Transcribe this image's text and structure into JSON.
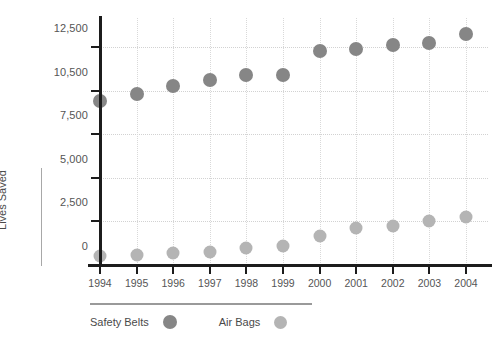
{
  "chart_data": {
    "type": "scatter",
    "title": "",
    "xlabel": "",
    "ylabel": "Lives Saved",
    "categories": [
      "1994",
      "1995",
      "1996",
      "1997",
      "1998",
      "1999",
      "2000",
      "2001",
      "2002",
      "2003",
      "2004"
    ],
    "series": [
      {
        "name": "Safety Belts",
        "color": "#868686",
        "marker": "circle",
        "values": [
          9800,
          10300,
          10700,
          11000,
          11200,
          11200,
          12300,
          12400,
          12600,
          12700,
          13100
        ]
      },
      {
        "name": "Air Bags",
        "color": "#b4b4b4",
        "marker": "circle",
        "values": [
          500,
          550,
          700,
          750,
          950,
          1100,
          1650,
          2100,
          2250,
          2500,
          2750
        ]
      }
    ],
    "y_ticks": [
      0,
      2500,
      5000,
      7500,
      10500,
      12500
    ],
    "y_tick_labels": [
      "0",
      "2,500",
      "5,000",
      "7,500",
      "10,500",
      "12,500"
    ],
    "ylim": [
      0,
      13400
    ],
    "grid": true,
    "grid_style": "dotted",
    "legend_position": "bottom-left"
  },
  "legend": {
    "items": [
      {
        "label": "Safety Belts",
        "key": "belts"
      },
      {
        "label": "Air Bags",
        "key": "bags"
      }
    ]
  }
}
